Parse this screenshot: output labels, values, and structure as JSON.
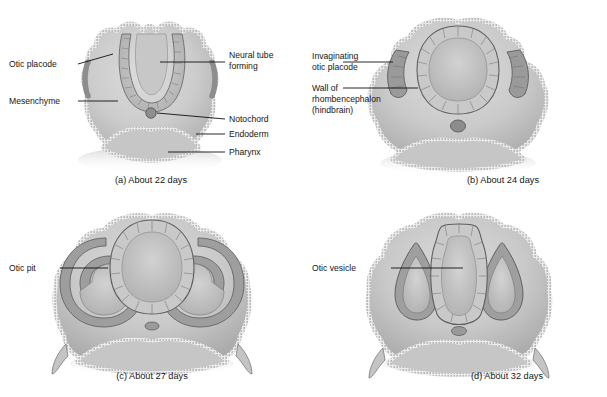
{
  "figure": {
    "style": {
      "background": "#ffffff",
      "mesenchyme_fill": "#cfcfcf",
      "mesenchyme_fill_dark": "#b4b4b4",
      "lumen_fill": "#c2c2c2",
      "epithelium_stroke": "#555555",
      "epithelium_light": "#efefef",
      "leader_line": "#101010",
      "text": "#161616"
    }
  },
  "panels": [
    {
      "id": "a",
      "caption": "(a) About 22 days",
      "labels": [
        {
          "key": "otic_placode",
          "text": "Otic placode",
          "side": "left"
        },
        {
          "key": "mesenchyme",
          "text": "Mesenchyme",
          "side": "left"
        },
        {
          "key": "neural_tube_l1",
          "text": "Neural tube",
          "side": "right"
        },
        {
          "key": "neural_tube_l2",
          "text": "forming",
          "side": "right"
        },
        {
          "key": "notochord",
          "text": "Notochord",
          "side": "right"
        },
        {
          "key": "endoderm",
          "text": "Endoderm",
          "side": "right"
        },
        {
          "key": "pharynx",
          "text": "Pharynx",
          "side": "right"
        }
      ]
    },
    {
      "id": "b",
      "caption": "(b) About 24 days",
      "labels": [
        {
          "key": "invaginating_l1",
          "text": "Invaginating",
          "side": "left"
        },
        {
          "key": "invaginating_l2",
          "text": "otic placode",
          "side": "left"
        },
        {
          "key": "wall_l1",
          "text": "Wall of",
          "side": "left"
        },
        {
          "key": "wall_l2",
          "text": "rhombencephalon",
          "side": "left"
        },
        {
          "key": "wall_l3",
          "text": "(hindbrain)",
          "side": "left"
        }
      ]
    },
    {
      "id": "c",
      "caption": "(c) About 27 days",
      "labels": [
        {
          "key": "otic_pit",
          "text": "Otic pit",
          "side": "left"
        }
      ]
    },
    {
      "id": "d",
      "caption": "(d) About 32 days",
      "labels": [
        {
          "key": "otic_vesicle",
          "text": "Otic vesicle",
          "side": "left"
        }
      ]
    }
  ]
}
